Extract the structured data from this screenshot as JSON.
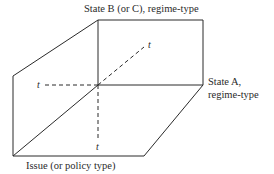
{
  "diagram": {
    "labels": {
      "state_b": "State B (or C), regime-type",
      "state_a_line1": "State A,",
      "state_a_line2": "regime-type",
      "issue": "Issue (or policy type)"
    },
    "axis_markers": {
      "t_diagonal": "t",
      "t_left": "t",
      "t_bottom": "t"
    },
    "colors": {
      "line": "#2a2a2a",
      "background": "#ffffff"
    }
  }
}
